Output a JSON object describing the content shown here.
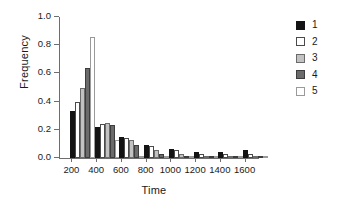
{
  "chart_data": {
    "type": "bar",
    "title": "",
    "xlabel": "Time",
    "ylabel": "Frequency",
    "xlim": [
      100,
      1700
    ],
    "ylim": [
      0.0,
      1.0
    ],
    "grid": false,
    "legend_position": "right-top",
    "y_ticks": [
      "1.0",
      "0.8",
      "0.6",
      "0.4",
      "0.2",
      "0.0"
    ],
    "y_tick_values": [
      1.0,
      0.8,
      0.6,
      0.4,
      0.2,
      0.0
    ],
    "x_ticks": [
      "200",
      "400",
      "600",
      "800",
      "1000",
      "1200",
      "1400",
      "1600"
    ],
    "x_tick_values": [
      200,
      400,
      600,
      800,
      1000,
      1200,
      1400,
      1600
    ],
    "categories": [
      200,
      400,
      600,
      800,
      1000,
      1200,
      1400,
      1600
    ],
    "series": [
      {
        "name": "1",
        "color": "#141414",
        "values": [
          0.335,
          0.22,
          0.15,
          0.095,
          0.065,
          0.045,
          0.04,
          0.055
        ]
      },
      {
        "name": "2",
        "color": "#ffffff",
        "values": [
          0.395,
          0.24,
          0.145,
          0.085,
          0.055,
          0.03,
          0.025,
          0.03
        ]
      },
      {
        "name": "3",
        "color": "#c2c2c2",
        "values": [
          0.495,
          0.245,
          0.13,
          0.06,
          0.025,
          0.012,
          0.01,
          0.012
        ]
      },
      {
        "name": "4",
        "color": "#6b6b6b",
        "values": [
          0.635,
          0.235,
          0.09,
          0.025,
          0.01,
          0.005,
          0.005,
          0.005
        ]
      },
      {
        "name": "5",
        "color": "#ffffff",
        "values": [
          0.855,
          0.13,
          0.015,
          0.005,
          0.003,
          0.002,
          0.002,
          0.002
        ]
      }
    ]
  },
  "legend": {
    "entries": [
      {
        "label": "1",
        "swatch": "legend-swatch-black"
      },
      {
        "label": "2",
        "swatch": "legend-swatch-white"
      },
      {
        "label": "3",
        "swatch": "legend-swatch-light-gray"
      },
      {
        "label": "4",
        "swatch": "legend-swatch-dark-gray"
      },
      {
        "label": "5",
        "swatch": "legend-swatch-white"
      }
    ]
  }
}
